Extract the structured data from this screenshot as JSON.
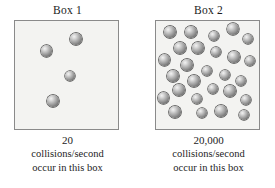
{
  "figure": {
    "background_color": "#ffffff",
    "box_fill_color": "#f3f3f1",
    "box_border_color": "#8a8a8a",
    "molecule_color": "#7b7b7b"
  },
  "panels": [
    {
      "title": "Box 1",
      "count": "20",
      "caption_line1": "collisions/second",
      "caption_line2": "occur in this box",
      "molecule_count": 4,
      "molecules": [
        {
          "x": 61.0,
          "y": 18.0,
          "r": 5.6
        },
        {
          "x": 31.5,
          "y": 30.0,
          "r": 5.6
        },
        {
          "x": 55.0,
          "y": 55.0,
          "r": 5.4
        },
        {
          "x": 38.0,
          "y": 80.0,
          "r": 5.6
        }
      ]
    },
    {
      "title": "Box 2",
      "count": "20,000",
      "caption_line1": "collisions/second",
      "caption_line2": "occur in this box",
      "molecule_count": 27,
      "molecules": [
        {
          "x": 14.0,
          "y": 11.0,
          "r": 5.6
        },
        {
          "x": 35.0,
          "y": 11.0,
          "r": 5.6
        },
        {
          "x": 58.0,
          "y": 15.0,
          "r": 5.2
        },
        {
          "x": 77.0,
          "y": 8.0,
          "r": 6.0
        },
        {
          "x": 92.0,
          "y": 18.0,
          "r": 5.4
        },
        {
          "x": 24.0,
          "y": 27.0,
          "r": 5.6
        },
        {
          "x": 42.0,
          "y": 27.0,
          "r": 5.6
        },
        {
          "x": 60.0,
          "y": 31.0,
          "r": 5.4
        },
        {
          "x": 8.5,
          "y": 39.0,
          "r": 5.6
        },
        {
          "x": 78.0,
          "y": 36.0,
          "r": 5.6
        },
        {
          "x": 94.0,
          "y": 40.0,
          "r": 5.4
        },
        {
          "x": 31.0,
          "y": 44.0,
          "r": 5.6
        },
        {
          "x": 51.0,
          "y": 50.0,
          "r": 5.4
        },
        {
          "x": 17.0,
          "y": 55.0,
          "r": 5.6
        },
        {
          "x": 69.0,
          "y": 54.0,
          "r": 5.4
        },
        {
          "x": 38.0,
          "y": 60.0,
          "r": 5.6
        },
        {
          "x": 85.0,
          "y": 60.0,
          "r": 5.4
        },
        {
          "x": 23.0,
          "y": 69.0,
          "r": 5.6
        },
        {
          "x": 57.0,
          "y": 68.0,
          "r": 5.4
        },
        {
          "x": 74.0,
          "y": 70.0,
          "r": 5.6
        },
        {
          "x": 7.5,
          "y": 77.0,
          "r": 5.6
        },
        {
          "x": 41.0,
          "y": 78.0,
          "r": 5.4
        },
        {
          "x": 90.0,
          "y": 79.0,
          "r": 5.4
        },
        {
          "x": 19.0,
          "y": 91.0,
          "r": 5.6
        },
        {
          "x": 46.0,
          "y": 92.0,
          "r": 5.4
        },
        {
          "x": 65.0,
          "y": 90.0,
          "r": 5.6
        },
        {
          "x": 88.0,
          "y": 94.0,
          "r": 5.4
        }
      ]
    }
  ]
}
